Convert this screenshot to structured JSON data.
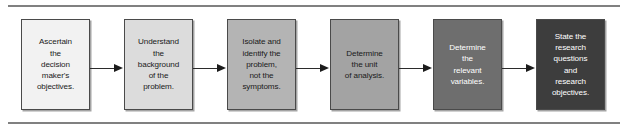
{
  "figure": {
    "type": "process-flow-diagram",
    "orientation": "horizontal",
    "rules": {
      "top_label": "top-divider-rule",
      "bottom_label": "bottom-divider-rule",
      "color": "#808080"
    },
    "steps": [
      {
        "index": 1,
        "text": "Ascertain\nthe\ndecision\nmaker's\nobjectives.",
        "fill": "#f2f2f2",
        "text_color": "#1a1a1a"
      },
      {
        "index": 2,
        "text": "Understand\nthe\nbackground\nof the\nproblem.",
        "fill": "#dcdcdc",
        "text_color": "#1a1a1a"
      },
      {
        "index": 3,
        "text": "Isolate and\nidentify the\nproblem,\nnot the\nsymptoms.",
        "fill": "#b4b4b4",
        "text_color": "#1a1a1a"
      },
      {
        "index": 4,
        "text": "Determine\nthe unit\nof analysis.",
        "fill": "#a3a3a3",
        "text_color": "#1a1a1a"
      },
      {
        "index": 5,
        "text": "Determine\nthe\nrelevant\nvariables.",
        "fill": "#6e6e6e",
        "text_color": "#ffffff"
      },
      {
        "index": 6,
        "text": "State the\nresearch\nquestions\nand\nresearch\nobjectives.",
        "fill": "#3d3d3d",
        "text_color": "#ffffff"
      }
    ],
    "connectors": [
      {
        "from": 1,
        "to": 2,
        "kind": "arrow-right"
      },
      {
        "from": 2,
        "to": 3,
        "kind": "arrow-right"
      },
      {
        "from": 3,
        "to": 4,
        "kind": "arrow-right"
      },
      {
        "from": 4,
        "to": 5,
        "kind": "arrow-right"
      },
      {
        "from": 5,
        "to": 6,
        "kind": "arrow-right"
      }
    ]
  }
}
